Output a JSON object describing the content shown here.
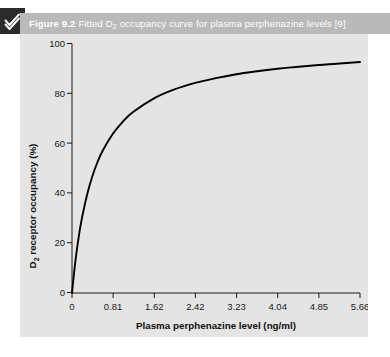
{
  "figure": {
    "logo_icon": "check-mark-icon",
    "caption_number": "Figure 9.2",
    "caption_pre": "Fitted D",
    "caption_sub": "2",
    "caption_post": " occupancy curve for plasma perphenazine levels [9]",
    "caption_full": "Figure 9.2 Fitted D2 occupancy curve for plasma perphenazine levels [9]",
    "header_bg": "#b9b9b9",
    "panel_bg": "#e4e4e4",
    "curve_color": "#000000"
  },
  "chart_data": {
    "type": "line",
    "title": "Fitted D2 occupancy curve for plasma perphenazine levels",
    "xlabel_pre": "Plasma perphenazine level (ng/ml)",
    "ylabel_pre": "D",
    "ylabel_sub": "2",
    "ylabel_post": " receptor occupancy (%)",
    "xlabel": "Plasma perphenazine level (ng/ml)",
    "ylabel": "D2 receptor occupancy (%)",
    "xlim": [
      0,
      5.66
    ],
    "ylim": [
      0,
      100
    ],
    "xticks": [
      0,
      0.81,
      1.62,
      2.42,
      3.23,
      4.04,
      4.85,
      5.66
    ],
    "xtick_labels": [
      "0",
      "0.81",
      "1.62",
      "2.42",
      "3.23",
      "4.04",
      "4.85",
      "5.66"
    ],
    "yticks": [
      0,
      20,
      40,
      60,
      80,
      100
    ],
    "ytick_labels": [
      "0",
      "20",
      "40",
      "60",
      "80",
      "100"
    ],
    "grid": false,
    "legend": false,
    "series": [
      {
        "name": "Fitted D2 occupancy",
        "model": "Emax hyperbolic: occupancy = 100 * C / (C + 0.455)",
        "x": [
          0,
          0.05,
          0.1,
          0.15,
          0.2,
          0.3,
          0.4,
          0.5,
          0.6,
          0.81,
          1.0,
          1.2,
          1.62,
          2.0,
          2.42,
          2.8,
          3.23,
          3.6,
          4.04,
          4.4,
          4.85,
          5.2,
          5.66
        ],
        "y": [
          0,
          9.9,
          18.0,
          24.8,
          30.5,
          39.7,
          46.8,
          52.4,
          56.9,
          64.0,
          68.7,
          72.5,
          78.1,
          81.5,
          84.2,
          86.0,
          87.7,
          88.8,
          89.9,
          90.6,
          91.4,
          91.9,
          92.6
        ]
      }
    ]
  }
}
